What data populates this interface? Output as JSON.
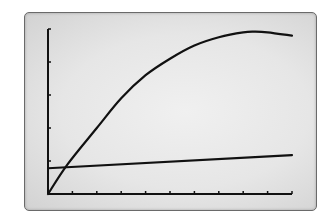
{
  "chart_data": {
    "type": "line",
    "title": "",
    "xlabel": "",
    "ylabel": "",
    "grid": false,
    "legend": null,
    "x_ticks": 10,
    "y_ticks": 5,
    "xlim": [
      0,
      10
    ],
    "ylim": [
      0,
      5
    ],
    "series": [
      {
        "name": "curve",
        "shape": "concave-down parabola",
        "x": [
          0,
          0.8,
          2,
          3,
          4,
          5,
          6,
          7,
          8,
          8.5,
          9,
          10
        ],
        "y": [
          0,
          0.9,
          2.0,
          2.9,
          3.6,
          4.1,
          4.5,
          4.75,
          4.9,
          4.92,
          4.9,
          4.8
        ]
      },
      {
        "name": "line",
        "shape": "linear",
        "x": [
          0,
          10
        ],
        "y": [
          0.78,
          1.18
        ]
      }
    ],
    "colors": {
      "curve": "#111111",
      "line": "#111111",
      "axes": "#111111",
      "screen_bg": "#e8e8e8",
      "frame": "#6a6a6a"
    }
  }
}
